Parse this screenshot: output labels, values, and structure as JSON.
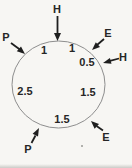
{
  "diagram": {
    "colors": {
      "background": "#f7f6f3",
      "circle_stroke": "#8e8e8e",
      "arrow": "#1f1f1f",
      "text": "#262626"
    },
    "outer_labels": [
      {
        "position": "top",
        "label": "H"
      },
      {
        "position": "upper-left",
        "label": "P"
      },
      {
        "position": "upper-right",
        "label": "E"
      },
      {
        "position": "right",
        "label": "H"
      },
      {
        "position": "lower-right",
        "label": "E"
      },
      {
        "position": "lower-left",
        "label": "P"
      }
    ],
    "inner_values": [
      {
        "position": "upper-left",
        "value": "1"
      },
      {
        "position": "upper-right",
        "value": "1"
      },
      {
        "position": "right-upper",
        "value": "0.5"
      },
      {
        "position": "left",
        "value": "2.5"
      },
      {
        "position": "right-lower",
        "value": "1.5"
      },
      {
        "position": "bottom",
        "value": "1.5"
      }
    ]
  }
}
